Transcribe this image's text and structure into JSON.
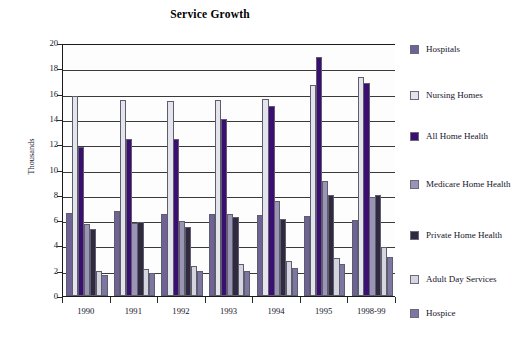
{
  "chart_data": {
    "type": "bar",
    "title": "Service Growth",
    "xlabel": "",
    "ylabel": "Thousands",
    "ylim": [
      0,
      20
    ],
    "ytick_step": 2,
    "ytick_labels": [
      "0",
      "2",
      "4",
      "6",
      "8",
      "10",
      "12",
      "14",
      "16",
      "18",
      "20"
    ],
    "grid": true,
    "legend_position": "right",
    "categories": [
      "1990",
      "1991",
      "1992",
      "1993",
      "1994",
      "1995",
      "1998-99"
    ],
    "series": [
      {
        "name": "Hospitals",
        "color": "#6f6395",
        "values": [
          6.6,
          6.7,
          6.5,
          6.5,
          6.4,
          6.3,
          6.0
        ]
      },
      {
        "name": "Nursing Homes",
        "color": "#e4e4ec",
        "values": [
          15.8,
          15.5,
          15.4,
          15.5,
          15.55,
          16.7,
          17.3
        ]
      },
      {
        "name": "All Home Health",
        "color": "#3b0f72",
        "values": [
          11.75,
          12.4,
          12.45,
          14.0,
          15.0,
          18.9,
          16.8
        ]
      },
      {
        "name": "Medicare Home Health",
        "color": "#9a95b4",
        "values": [
          5.7,
          5.8,
          5.95,
          6.45,
          7.5,
          9.1,
          7.8
        ]
      },
      {
        "name": "Private Home Health",
        "color": "#2f2a3f",
        "values": [
          5.3,
          5.85,
          5.45,
          6.25,
          6.1,
          8.0,
          7.95
        ]
      },
      {
        "name": "Adult Day Services",
        "color": "#d5d5e0",
        "values": [
          2.0,
          2.15,
          2.4,
          2.55,
          2.75,
          3.0,
          3.9
        ]
      },
      {
        "name": "Hospice",
        "color": "#7c77a0",
        "values": [
          1.65,
          1.85,
          1.95,
          2.0,
          2.25,
          2.5,
          3.1
        ]
      }
    ]
  },
  "legend": {
    "items": [
      {
        "label": "Hospitals",
        "color": "#6f6395"
      },
      {
        "label": "Nursing Homes",
        "color": "#e4e4ec"
      },
      {
        "label": "All Home Health",
        "color": "#3b0f72"
      },
      {
        "label": "Medicare Home Health",
        "color": "#9a95b4"
      },
      {
        "label": "Private Home Health",
        "color": "#2f2a3f"
      },
      {
        "label": "Adult Day Services",
        "color": "#d5d5e0"
      },
      {
        "label": "Hospice",
        "color": "#7c77a0"
      }
    ]
  },
  "axes": {
    "y_title": "Thousands"
  }
}
